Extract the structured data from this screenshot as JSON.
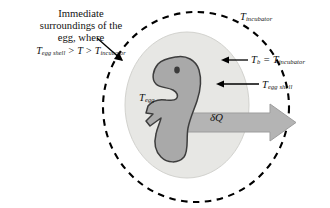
{
  "figure": {
    "background_color": "#ffffff"
  },
  "annotations": {
    "surroundings": {
      "line1": "Immediate",
      "line2": "surroundings of the",
      "line3": "egg, where",
      "inequality_prefix": "T",
      "inequality_sub1": "egg shell",
      "inequality_mid": " > T > ",
      "inequality_prefix2": "T",
      "inequality_sub2": "incubator"
    },
    "t_incubator": {
      "symbol": "T",
      "subscript": "incubator"
    },
    "t_b": {
      "symbol": "T",
      "subscript": "b",
      "equals": " = ",
      "symbol2": "T",
      "subscript2": "incubator"
    },
    "t_egg_shell": {
      "symbol": "T",
      "subscript": "egg shell"
    },
    "t_egg": {
      "symbol": "T",
      "subscript": "egg"
    },
    "heat_flux": {
      "symbol": "δQ"
    }
  },
  "shapes": {
    "dashed_boundary": {
      "name": "control-volume-boundary",
      "style": "dashed ellipse",
      "stroke_color": "#000000",
      "fill": "none",
      "cx": 195,
      "cy": 107,
      "rx": 93,
      "ry": 94
    },
    "egg_shell": {
      "name": "egg-shell-ellipse",
      "fill_color": "#e7e7e4",
      "stroke_color": "#cfcfcb",
      "cx": 187,
      "cy": 105,
      "rx": 62,
      "ry": 73
    },
    "embryo": {
      "name": "chick-embryo",
      "fill_color": "#a9a9a9",
      "stroke_color": "#3d3d3d"
    },
    "eye": {
      "name": "embryo-eye",
      "fill_color": "#3d3d3d"
    },
    "heat_arrow": {
      "name": "heat-flux-arrow",
      "fill_color": "#b4b4b4",
      "stroke_color": "#9a9a9a",
      "direction": "right"
    }
  },
  "leaders": [
    {
      "name": "leader-surroundings",
      "from": [
        98,
        44
      ],
      "to": [
        124,
        62
      ]
    },
    {
      "name": "leader-t-b",
      "from": [
        248,
        60
      ],
      "to": [
        222,
        60
      ]
    },
    {
      "name": "leader-t-egg-shell",
      "from": [
        258,
        84
      ],
      "to": [
        215,
        84
      ]
    }
  ]
}
